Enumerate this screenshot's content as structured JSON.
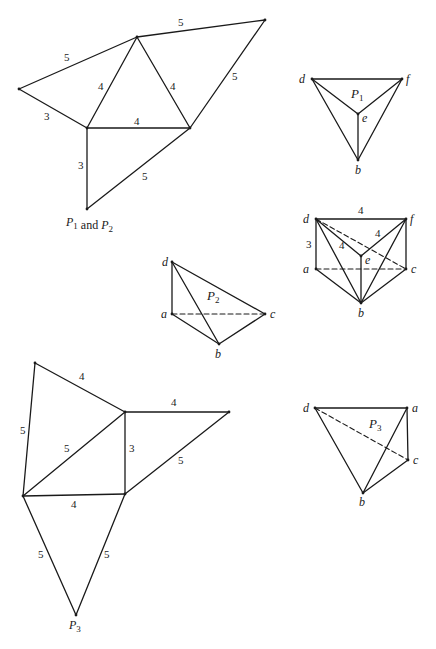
{
  "canvas": {
    "width": 436,
    "height": 649,
    "stroke_color": "#1a1a1a",
    "background": "#ffffff"
  },
  "figures": [
    {
      "id": "net-p1-p2",
      "name": "net-p1-and-p2",
      "caption": {
        "parts": [
          [
            "P",
            "1"
          ],
          " and ",
          [
            "P",
            "2"
          ]
        ],
        "x": 66,
        "y": 226
      },
      "points": {
        "L": [
          19,
          89
        ],
        "T": [
          137,
          37
        ],
        "TR": [
          265,
          20
        ],
        "M": [
          87,
          128
        ],
        "R": [
          190,
          128
        ],
        "B": [
          87,
          209
        ]
      },
      "edges": [
        [
          "L",
          "T",
          false
        ],
        [
          "T",
          "TR",
          false
        ],
        [
          "TR",
          "R",
          false
        ],
        [
          "L",
          "M",
          false
        ],
        [
          "M",
          "T",
          false
        ],
        [
          "T",
          "R",
          false
        ],
        [
          "M",
          "R",
          false
        ],
        [
          "M",
          "B",
          false
        ],
        [
          "B",
          "R",
          false
        ]
      ],
      "lengths": [
        {
          "text": "5",
          "x": 64,
          "y": 61
        },
        {
          "text": "5",
          "x": 178,
          "y": 26
        },
        {
          "text": "5",
          "x": 232,
          "y": 80
        },
        {
          "text": "3",
          "x": 44,
          "y": 120
        },
        {
          "text": "4",
          "x": 98,
          "y": 90
        },
        {
          "text": "4",
          "x": 170,
          "y": 90
        },
        {
          "text": "4",
          "x": 134,
          "y": 125
        },
        {
          "text": "3",
          "x": 78,
          "y": 169
        },
        {
          "text": "5",
          "x": 142,
          "y": 180
        }
      ],
      "vertex_labels": []
    },
    {
      "id": "tetra-p1",
      "name": "tetrahedron-p1",
      "title": {
        "parts": [
          [
            "P",
            "1"
          ]
        ],
        "x": 351,
        "y": 98
      },
      "points": {
        "d": [
          312,
          79
        ],
        "f": [
          402,
          79
        ],
        "e": [
          358,
          114
        ],
        "b": [
          358,
          160
        ]
      },
      "edges": [
        [
          "d",
          "f",
          false
        ],
        [
          "d",
          "e",
          false
        ],
        [
          "e",
          "f",
          false
        ],
        [
          "d",
          "b",
          false
        ],
        [
          "f",
          "b",
          false
        ],
        [
          "e",
          "b",
          false
        ]
      ],
      "lengths": [],
      "vertex_labels": [
        {
          "text": "d",
          "x": 299,
          "y": 83
        },
        {
          "text": "f",
          "x": 406,
          "y": 83
        },
        {
          "text": "e",
          "x": 362,
          "y": 122
        },
        {
          "text": "b",
          "x": 355,
          "y": 174
        }
      ]
    },
    {
      "id": "prism",
      "name": "triangular-prism-assembled",
      "points": {
        "d": [
          316,
          219
        ],
        "f": [
          406,
          219
        ],
        "a": [
          316,
          269
        ],
        "c": [
          406,
          269
        ],
        "e": [
          361,
          256
        ],
        "b": [
          361,
          303
        ]
      },
      "edges": [
        [
          "d",
          "f",
          false
        ],
        [
          "d",
          "a",
          false
        ],
        [
          "f",
          "c",
          false
        ],
        [
          "a",
          "c",
          true
        ],
        [
          "d",
          "c",
          true
        ],
        [
          "d",
          "e",
          false
        ],
        [
          "e",
          "f",
          false
        ],
        [
          "e",
          "b",
          false
        ],
        [
          "d",
          "b",
          false
        ],
        [
          "a",
          "b",
          false
        ],
        [
          "f",
          "b",
          false
        ],
        [
          "c",
          "b",
          false
        ]
      ],
      "lengths": [
        {
          "text": "4",
          "x": 358,
          "y": 214
        },
        {
          "text": "3",
          "x": 306,
          "y": 248
        },
        {
          "text": "4",
          "x": 339,
          "y": 249
        },
        {
          "text": "4",
          "x": 375,
          "y": 237
        }
      ],
      "vertex_labels": [
        {
          "text": "d",
          "x": 303,
          "y": 223
        },
        {
          "text": "f",
          "x": 410,
          "y": 223
        },
        {
          "text": "a",
          "x": 303,
          "y": 273
        },
        {
          "text": "c",
          "x": 411,
          "y": 273
        },
        {
          "text": "e",
          "x": 365,
          "y": 264
        },
        {
          "text": "b",
          "x": 358,
          "y": 317
        }
      ]
    },
    {
      "id": "tetra-p2",
      "name": "tetrahedron-p2",
      "title": {
        "parts": [
          [
            "P",
            "2"
          ]
        ],
        "x": 207,
        "y": 300
      },
      "points": {
        "d": [
          172,
          262
        ],
        "a": [
          172,
          314
        ],
        "c": [
          265,
          314
        ],
        "b": [
          219,
          344
        ]
      },
      "edges": [
        [
          "d",
          "a",
          false
        ],
        [
          "d",
          "c",
          false
        ],
        [
          "d",
          "b",
          false
        ],
        [
          "a",
          "b",
          false
        ],
        [
          "b",
          "c",
          false
        ],
        [
          "a",
          "c",
          true
        ]
      ],
      "lengths": [],
      "vertex_labels": [
        {
          "text": "d",
          "x": 162,
          "y": 266
        },
        {
          "text": "a",
          "x": 161,
          "y": 318
        },
        {
          "text": "c",
          "x": 270,
          "y": 318
        },
        {
          "text": "b",
          "x": 215,
          "y": 358
        }
      ]
    },
    {
      "id": "net-p3",
      "name": "net-p3",
      "caption": {
        "parts": [
          [
            "P",
            "3"
          ]
        ],
        "x": 69,
        "y": 629
      },
      "points": {
        "TL": [
          35,
          363
        ],
        "MT": [
          125,
          412
        ],
        "TR": [
          229,
          412
        ],
        "BL": [
          23,
          496
        ],
        "MB": [
          125,
          494
        ],
        "AP": [
          76,
          615
        ]
      },
      "edges": [
        [
          "TL",
          "MT",
          false
        ],
        [
          "TL",
          "BL",
          false
        ],
        [
          "BL",
          "MT",
          false
        ],
        [
          "MT",
          "TR",
          false
        ],
        [
          "MT",
          "MB",
          false
        ],
        [
          "TR",
          "MB",
          false
        ],
        [
          "BL",
          "MB",
          false
        ],
        [
          "BL",
          "AP",
          false
        ],
        [
          "MB",
          "AP",
          false
        ]
      ],
      "lengths": [
        {
          "text": "4",
          "x": 79,
          "y": 380
        },
        {
          "text": "4",
          "x": 171,
          "y": 406
        },
        {
          "text": "5",
          "x": 20,
          "y": 434
        },
        {
          "text": "5",
          "x": 64,
          "y": 452
        },
        {
          "text": "3",
          "x": 129,
          "y": 452
        },
        {
          "text": "5",
          "x": 178,
          "y": 464
        },
        {
          "text": "4",
          "x": 71,
          "y": 508
        },
        {
          "text": "5",
          "x": 38,
          "y": 558
        },
        {
          "text": "5",
          "x": 104,
          "y": 558
        }
      ],
      "vertex_labels": []
    },
    {
      "id": "tetra-p3",
      "name": "tetrahedron-p3",
      "title": {
        "parts": [
          [
            "P",
            "3"
          ]
        ],
        "x": 369,
        "y": 428
      },
      "points": {
        "d": [
          315,
          408
        ],
        "a": [
          407,
          408
        ],
        "c": [
          408,
          460
        ],
        "b": [
          363,
          493
        ]
      },
      "edges": [
        [
          "d",
          "a",
          false
        ],
        [
          "a",
          "c",
          false
        ],
        [
          "d",
          "b",
          false
        ],
        [
          "a",
          "b",
          false
        ],
        [
          "b",
          "c",
          false
        ],
        [
          "d",
          "c",
          true
        ]
      ],
      "lengths": [],
      "vertex_labels": [
        {
          "text": "d",
          "x": 303,
          "y": 412
        },
        {
          "text": "a",
          "x": 412,
          "y": 412
        },
        {
          "text": "c",
          "x": 413,
          "y": 464
        },
        {
          "text": "b",
          "x": 359,
          "y": 506
        }
      ]
    }
  ]
}
